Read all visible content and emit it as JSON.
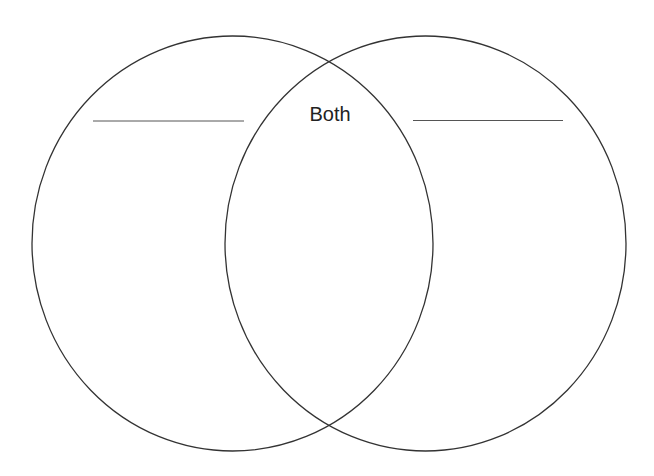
{
  "diagram": {
    "type": "venn",
    "intersection_label": "Both",
    "left_set": {
      "label": "",
      "label_line": true
    },
    "right_set": {
      "label": "",
      "label_line": true
    },
    "colors": {
      "stroke": "#333333",
      "line": "#555555",
      "text": "#222222",
      "background": "#ffffff"
    }
  }
}
